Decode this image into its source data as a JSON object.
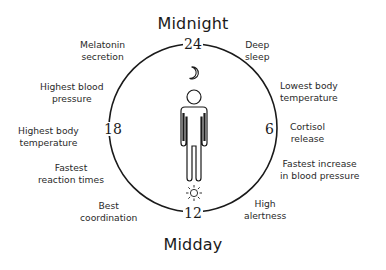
{
  "diagram": {
    "title_top": "Midnight",
    "title_bottom": "Midday",
    "hours": {
      "h24": "24",
      "h6": "6",
      "h12": "12",
      "h18": "18"
    },
    "icons": {
      "top": "moon-icon",
      "bottom": "sun-icon",
      "center": "person-icon"
    },
    "events": [
      {
        "id": "melatonin",
        "line1": "Melatonin",
        "line2": "secretion"
      },
      {
        "id": "deep_sleep",
        "line1": "Deep",
        "line2": "sleep"
      },
      {
        "id": "lowest_temp",
        "line1": "Lowest body",
        "line2": "temperature"
      },
      {
        "id": "cortisol",
        "line1": "Cortisol",
        "line2": "release"
      },
      {
        "id": "bp_increase",
        "line1": "Fastest increase",
        "line2": "in blood pressure"
      },
      {
        "id": "alertness",
        "line1": "High",
        "line2": "alertness"
      },
      {
        "id": "coordination",
        "line1": "Best",
        "line2": "coordination"
      },
      {
        "id": "reaction",
        "line1": "Fastest",
        "line2": "reaction times"
      },
      {
        "id": "highest_temp",
        "line1": "Highest body",
        "line2": "temperature"
      },
      {
        "id": "highest_bp",
        "line1": "Highest blood",
        "line2": "pressure"
      }
    ],
    "colors": {
      "stroke": "#1a1a1a",
      "text": "#2a2a2a",
      "background": "#ffffff"
    }
  }
}
